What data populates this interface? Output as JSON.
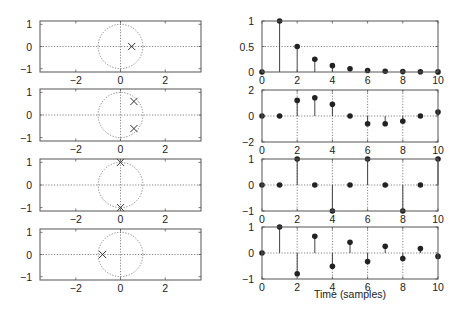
{
  "figure": {
    "xlabel_right": "Time (samples)"
  },
  "chart_data": [
    {
      "type": "scatter",
      "name": "pole-zero-plot-1",
      "title": "",
      "xlabel": "",
      "ylabel": "",
      "xlim": [
        -3.6,
        3.6
      ],
      "ylim": [
        -1.15,
        1.15
      ],
      "xticks": [
        -2,
        0,
        2
      ],
      "yticks": [
        -1,
        0,
        1
      ],
      "unit_circle": true,
      "poles": [
        [
          0.5,
          0
        ]
      ],
      "grid": "dotted axes at 0"
    },
    {
      "type": "bar",
      "subtype": "stem",
      "name": "impulse-response-1",
      "x": [
        0,
        1,
        2,
        3,
        4,
        5,
        6,
        7,
        8,
        9,
        10
      ],
      "values": [
        0,
        1,
        0.5,
        0.25,
        0.125,
        0.0625,
        0.03,
        0.016,
        0.008,
        0.004,
        0.002
      ],
      "xlim": [
        0,
        10
      ],
      "ylim": [
        0,
        1
      ],
      "xticks": [
        0,
        2,
        4,
        6,
        8,
        10
      ],
      "yticks": [
        0,
        0.5,
        1
      ],
      "ytick_labels": [
        "0",
        "0.5",
        "1"
      ],
      "grid": "dotted at y=0.5"
    },
    {
      "type": "scatter",
      "name": "pole-zero-plot-2",
      "xlim": [
        -3.6,
        3.6
      ],
      "ylim": [
        -1.15,
        1.15
      ],
      "xticks": [
        -2,
        0,
        2
      ],
      "yticks": [
        -1,
        0,
        1
      ],
      "unit_circle": true,
      "poles": [
        [
          0.6,
          0.6
        ],
        [
          0.6,
          -0.6
        ]
      ]
    },
    {
      "type": "bar",
      "subtype": "stem",
      "name": "impulse-response-2",
      "x": [
        0,
        1,
        2,
        3,
        4,
        5,
        6,
        7,
        8,
        9,
        10
      ],
      "values": [
        0,
        0,
        1.2,
        1.4,
        0.9,
        0,
        -0.6,
        -0.6,
        -0.4,
        0,
        0.3
      ],
      "xlim": [
        0,
        10
      ],
      "ylim": [
        -2,
        2
      ],
      "xticks": [
        0,
        2,
        4,
        6,
        8,
        10
      ],
      "yticks": [
        -2,
        0,
        2
      ],
      "ytick_labels": [
        "−2",
        "0",
        "2"
      ],
      "grid": "dotted at y=0 and x=2,4,6,8"
    },
    {
      "type": "scatter",
      "name": "pole-zero-plot-3",
      "xlim": [
        -3.6,
        3.6
      ],
      "ylim": [
        -1.15,
        1.15
      ],
      "xticks": [
        -2,
        0,
        2
      ],
      "yticks": [
        -1,
        0,
        1
      ],
      "unit_circle": true,
      "poles": [
        [
          0,
          1
        ],
        [
          0,
          -1
        ]
      ]
    },
    {
      "type": "bar",
      "subtype": "stem",
      "name": "impulse-response-3",
      "x": [
        0,
        1,
        2,
        3,
        4,
        5,
        6,
        7,
        8,
        9,
        10
      ],
      "values": [
        0,
        0,
        1,
        0,
        -1,
        0,
        1,
        0,
        -1,
        0,
        1
      ],
      "xlim": [
        0,
        10
      ],
      "ylim": [
        -1,
        1
      ],
      "xticks": [
        0,
        2,
        4,
        6,
        8,
        10
      ],
      "yticks": [
        -1,
        0,
        1
      ],
      "ytick_labels": [
        "−1",
        "0",
        "1"
      ],
      "grid": "dotted at y=0 and x=2,4,6,8"
    },
    {
      "type": "scatter",
      "name": "pole-zero-plot-4",
      "xlim": [
        -3.6,
        3.6
      ],
      "ylim": [
        -1.15,
        1.15
      ],
      "xticks": [
        -2,
        0,
        2
      ],
      "yticks": [
        -1,
        0,
        1
      ],
      "unit_circle": true,
      "poles": [
        [
          -0.8,
          0
        ]
      ]
    },
    {
      "type": "bar",
      "subtype": "stem",
      "name": "impulse-response-4",
      "x": [
        0,
        1,
        2,
        3,
        4,
        5,
        6,
        7,
        8,
        9,
        10
      ],
      "values": [
        0,
        1,
        -0.8,
        0.64,
        -0.51,
        0.41,
        -0.33,
        0.26,
        -0.21,
        0.17,
        -0.13
      ],
      "xlim": [
        0,
        10
      ],
      "ylim": [
        -1,
        1
      ],
      "xticks": [
        0,
        2,
        4,
        6,
        8,
        10
      ],
      "yticks": [
        -1,
        0,
        1
      ],
      "ytick_labels": [
        "−1",
        "0",
        "1"
      ],
      "xlabel": "Time (samples)",
      "grid": "dotted at y=0 and x=2,4,6,8"
    }
  ]
}
